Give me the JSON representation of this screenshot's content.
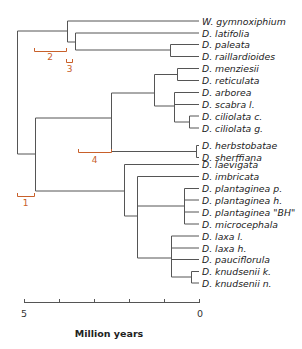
{
  "figure": {
    "type": "phylogenetic-tree",
    "line_color": "#555555",
    "bracket_color": "#c8602a"
  },
  "leaves": [
    "W. gymnoxiphium",
    "D. latifolia",
    "D. paleata",
    "D. raillardioides",
    "D. menziesii",
    "D. reticulata",
    "D. arborea",
    "D. scabra l.",
    "D. ciliolata c.",
    "D. ciliolata g.",
    "D. herbstobatae",
    "D. sherffiana",
    "D. laevigata",
    "D. imbricata",
    "D. plantaginea p.",
    "D. plantaginea h.",
    "D. plantaginea \"BH\"",
    "D. microcephala",
    "D. laxa l.",
    "D. laxa h.",
    "D. pauciflorula",
    "D. knudsenii k.",
    "D. knudsenii n."
  ],
  "brackets": [
    {
      "label": "1"
    },
    {
      "label": "2"
    },
    {
      "label": "3"
    },
    {
      "label": "4"
    }
  ],
  "axis": {
    "title": "Million years",
    "start_label": "5",
    "end_label": "0",
    "ticks": 6
  }
}
